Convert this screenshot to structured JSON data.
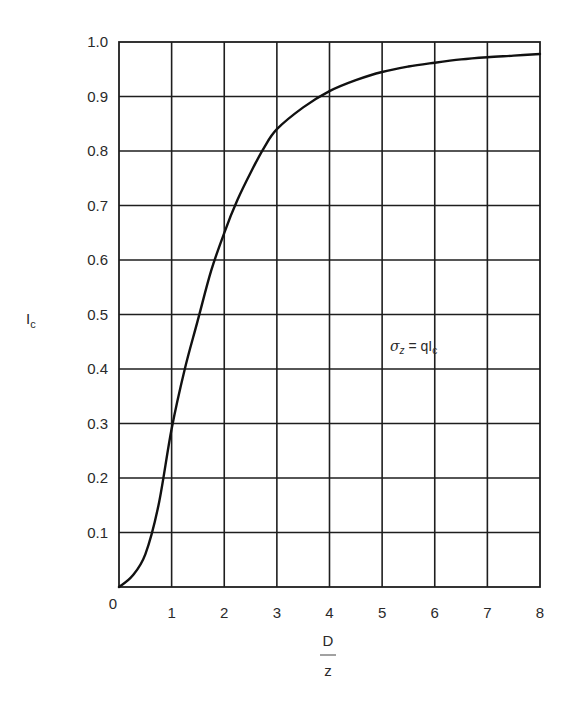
{
  "chart_data": {
    "type": "line",
    "title": "",
    "xlabel": "D/z",
    "xlabel_numerator": "D",
    "xlabel_denominator": "z",
    "ylabel": "Ic",
    "ylabel_main": "I",
    "ylabel_sub": "c",
    "xlim": [
      0,
      8
    ],
    "ylim": [
      0,
      1.0
    ],
    "grid": true,
    "legend": null,
    "x_ticks": [
      "0",
      "1",
      "2",
      "3",
      "4",
      "5",
      "6",
      "7",
      "8"
    ],
    "y_ticks": [
      "0.1",
      "0.2",
      "0.3",
      "0.4",
      "0.5",
      "0.6",
      "0.7",
      "0.8",
      "0.9",
      "1.0"
    ],
    "annotation": {
      "text": "σz = qIc",
      "sigma": "σ",
      "sigma_sub": "z",
      "eq": " = qI",
      "eq_sub": "c",
      "x": 5.2,
      "y": 0.45
    },
    "series": [
      {
        "name": "Ic",
        "x": [
          0,
          0.25,
          0.5,
          0.75,
          1.0,
          1.25,
          1.5,
          1.75,
          2.0,
          2.25,
          2.5,
          2.75,
          3.0,
          3.5,
          4.0,
          4.5,
          5.0,
          5.5,
          6.0,
          6.5,
          7.0,
          7.5,
          8.0
        ],
        "values": [
          0,
          0.02,
          0.06,
          0.15,
          0.29,
          0.4,
          0.49,
          0.58,
          0.65,
          0.71,
          0.76,
          0.805,
          0.84,
          0.88,
          0.91,
          0.93,
          0.945,
          0.955,
          0.962,
          0.968,
          0.972,
          0.975,
          0.978
        ]
      }
    ]
  }
}
